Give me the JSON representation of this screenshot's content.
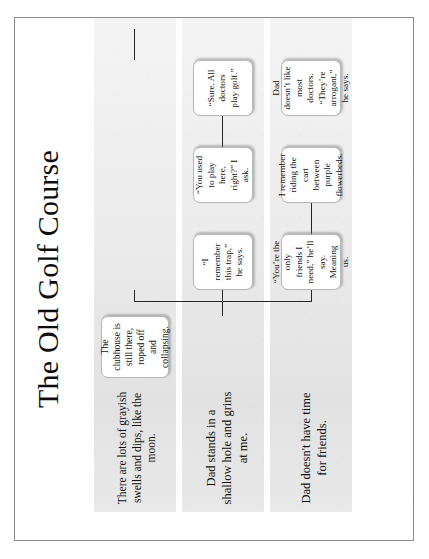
{
  "slide": {
    "title": "The Old Golf Course",
    "rotation_degrees": -90
  },
  "rows": [
    {
      "id": "row-swells",
      "label": "There are lots of grayish swells and dips, like the moon."
    },
    {
      "id": "row-shallow-hole",
      "label": "Dad stands in a shallow hole and grins at me."
    },
    {
      "id": "row-no-friends",
      "label": "Dad doesn't have time for friends."
    }
  ],
  "nodes": {
    "clubhouse": "The clubhouse is still there, roped off and collapsing.",
    "trap": "“I remember this trap,” he says.",
    "played": "“You used to play here, right?” I ask.",
    "sure": "“Sure.  All doctors play golf.”",
    "friends": "“You’re the only friends I need,” he’ll say. Meaning us.",
    "cart": "I remember riding the cart between purple flowerbeds.",
    "arrogant": "Dad doesn’t like most doctors. “They’re arrogant,” he says."
  },
  "colors": {
    "band_gray": "#e7e7e7",
    "node_border": "#b9b9b9",
    "connector": "#262626",
    "text": "#111111",
    "page_border": "#8d8d8d"
  }
}
